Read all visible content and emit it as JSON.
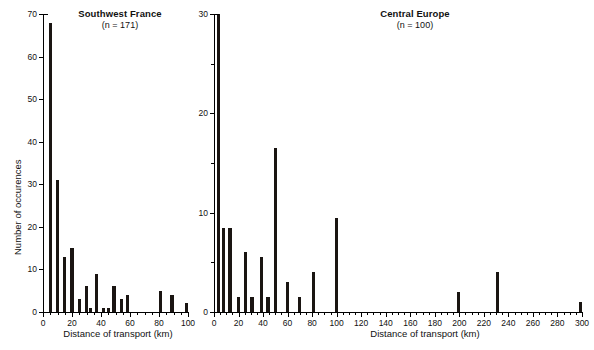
{
  "figure": {
    "width": 594,
    "height": 350,
    "background": "#ffffff",
    "bar_color": "#1a1512",
    "axis_color": "#000000"
  },
  "chart_data": [
    {
      "type": "bar",
      "title": "Southwest France",
      "subtitle": "(n = 171)",
      "n": 171,
      "xlabel": "Distance of transport (km)",
      "ylabel": "Number of occurences",
      "xlim": [
        0,
        100
      ],
      "ylim": [
        0,
        70
      ],
      "xticks": [
        0,
        20,
        40,
        60,
        80,
        100
      ],
      "xticklabels": [
        "0",
        "20",
        "40",
        "60",
        "80",
        "100"
      ],
      "xminorticks": [
        5,
        10,
        15,
        25,
        30,
        35,
        45,
        50,
        55,
        65,
        70,
        75,
        85,
        90,
        95
      ],
      "yticks": [
        0,
        10,
        20,
        30,
        40,
        50,
        60,
        70
      ],
      "yticklabels": [
        "0",
        "10",
        "20",
        "30",
        "40",
        "50",
        "60",
        "70"
      ],
      "grid": false,
      "legend": "none",
      "bin_width": 2.2,
      "x": [
        5,
        10,
        15,
        20,
        25,
        30,
        32,
        35,
        40,
        42,
        45,
        50,
        55,
        60,
        80,
        90,
        100
      ],
      "values": [
        68,
        31,
        13,
        15,
        3,
        6,
        1,
        9,
        1,
        1,
        6,
        3,
        4,
        0,
        5,
        4,
        2
      ],
      "points": [
        {
          "x": 5,
          "y": 68
        },
        {
          "x": 10,
          "y": 31
        },
        {
          "x": 15,
          "y": 13
        },
        {
          "x": 20,
          "y": 15
        },
        {
          "x": 25,
          "y": 3
        },
        {
          "x": 30,
          "y": 6
        },
        {
          "x": 33,
          "y": 1
        },
        {
          "x": 37,
          "y": 9
        },
        {
          "x": 42,
          "y": 1
        },
        {
          "x": 45,
          "y": 1
        },
        {
          "x": 49,
          "y": 6
        },
        {
          "x": 54,
          "y": 3
        },
        {
          "x": 58,
          "y": 4
        },
        {
          "x": 81,
          "y": 5
        },
        {
          "x": 89,
          "y": 4
        },
        {
          "x": 99,
          "y": 2
        }
      ]
    },
    {
      "type": "bar",
      "title": "Central Europe",
      "subtitle": "(n = 100)",
      "n": 100,
      "xlabel": "Distance of transport (km)",
      "ylabel": "",
      "xlim": [
        0,
        300
      ],
      "ylim": [
        0,
        30
      ],
      "xticks": [
        0,
        20,
        40,
        60,
        80,
        100,
        120,
        140,
        160,
        180,
        200,
        220,
        240,
        260,
        280,
        300
      ],
      "xticklabels": [
        "0",
        "20",
        "40",
        "60",
        "80",
        "100",
        "120",
        "140",
        "160",
        "180",
        "200",
        "220",
        "240",
        "260",
        "280",
        "300"
      ],
      "xminorticks": [
        5,
        10,
        15,
        25,
        30,
        35,
        45,
        50,
        55,
        65,
        70,
        75,
        85,
        90,
        95,
        105,
        110,
        115,
        125,
        130,
        135,
        145,
        150,
        155,
        165,
        170,
        175,
        185,
        190,
        195,
        205,
        210,
        215,
        225,
        230,
        235,
        245,
        250,
        255,
        265,
        270,
        275,
        285,
        290,
        295
      ],
      "yticks": [
        0,
        10,
        20,
        30
      ],
      "yticklabels": [
        "0",
        "10",
        "20",
        "30"
      ],
      "yminorticks": [
        5,
        15,
        25
      ],
      "grid": false,
      "legend": "none",
      "bin_width": 2.6,
      "x": [
        4,
        8,
        13,
        20,
        26,
        30,
        39,
        44,
        50,
        60,
        70,
        81,
        100,
        199,
        231,
        299
      ],
      "values": [
        30,
        8.5,
        8.5,
        1.5,
        6,
        1.5,
        5.5,
        1.5,
        16.5,
        3,
        1.5,
        4,
        9.5,
        2,
        4,
        1
      ],
      "points": [
        {
          "x": 4,
          "y": 30
        },
        {
          "x": 8,
          "y": 8.5
        },
        {
          "x": 13,
          "y": 8.5
        },
        {
          "x": 20,
          "y": 1.5
        },
        {
          "x": 26,
          "y": 6
        },
        {
          "x": 31,
          "y": 1.5
        },
        {
          "x": 39,
          "y": 5.5
        },
        {
          "x": 44,
          "y": 1.5
        },
        {
          "x": 50,
          "y": 16.5
        },
        {
          "x": 60,
          "y": 3
        },
        {
          "x": 70,
          "y": 1.5
        },
        {
          "x": 81,
          "y": 4
        },
        {
          "x": 100,
          "y": 9.5
        },
        {
          "x": 199,
          "y": 2
        },
        {
          "x": 231,
          "y": 4
        },
        {
          "x": 299,
          "y": 1
        }
      ]
    }
  ]
}
